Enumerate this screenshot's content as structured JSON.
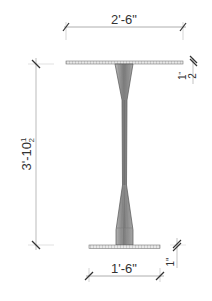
{
  "drawing": {
    "title": "Pedestal table elevation",
    "line_color": "#555555",
    "dim_color": "#888888",
    "dimensions": {
      "top_width": "2'-6\"",
      "base_width": "1'-6\"",
      "overall_height_main": "3'-10",
      "overall_height_frac_num": "1",
      "overall_height_frac_den": "2",
      "top_thickness_num": "1",
      "top_thickness_den": "2",
      "top_thickness_unit": "\"",
      "base_thickness": "1\""
    }
  }
}
